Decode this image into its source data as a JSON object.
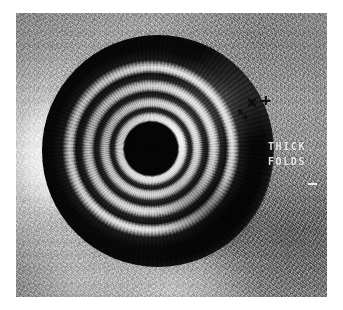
{
  "figure": {
    "modality": "endoscopic-ultrasound",
    "orientation": "radial-cross-section",
    "background_color": "#ffffff",
    "frame": {
      "left": 16,
      "top": 13,
      "width": 311,
      "height": 284,
      "base_color": "#9a9a9a"
    }
  },
  "annotations": {
    "labels": [
      {
        "id": "thick",
        "text": "THICK",
        "color": "#f4f4f4"
      },
      {
        "id": "folds",
        "text": "FOLDS",
        "color": "#f4f4f4"
      }
    ],
    "calipers": [
      {
        "id": "x1",
        "glyph": "×",
        "size": "large",
        "color": "#0a0a0a"
      },
      {
        "id": "p1",
        "glyph": "+",
        "size": "large",
        "color": "#0a0a0a"
      },
      {
        "id": "x2",
        "glyph": "×",
        "size": "small",
        "color": "#0a0a0a"
      },
      {
        "id": "p2",
        "glyph": "+",
        "size": "small",
        "color": "#0a0a0a"
      }
    ]
  },
  "structure": {
    "center": {
      "x": 0.47,
      "y": 0.49
    },
    "rings": [
      {
        "name": "lumen-core",
        "tone": "anechoic",
        "color": "#050505"
      },
      {
        "name": "inner-interface",
        "tone": "hyperechoic",
        "color": "#fbfbfb"
      },
      {
        "name": "ring-dark-1",
        "tone": "hypoechoic",
        "color": "#1b1b1b"
      },
      {
        "name": "mucosa-bright",
        "tone": "hyperechoic",
        "color": "#e6e6e6"
      },
      {
        "name": "submucosa-dark",
        "tone": "hypoechoic",
        "color": "#161616"
      },
      {
        "name": "ring-bright-2",
        "tone": "hyperechoic",
        "color": "#e2e2e2"
      },
      {
        "name": "muscularis-dark",
        "tone": "hypoechoic",
        "color": "#121212"
      },
      {
        "name": "ring-bright-3",
        "tone": "hyperechoic",
        "color": "#e4e4e4"
      },
      {
        "name": "thick-fold-band",
        "tone": "hypoechoic",
        "color": "#070707"
      },
      {
        "name": "outer-serosa-rim",
        "tone": "isoechoic",
        "color": "#b9b9b9"
      }
    ]
  }
}
